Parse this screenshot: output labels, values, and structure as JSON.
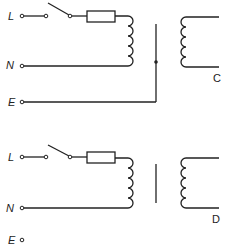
{
  "diagrams": [
    {
      "id": "C",
      "caption": "C",
      "terminals": [
        {
          "label": "L"
        },
        {
          "label": "N"
        },
        {
          "label": "E"
        }
      ],
      "core": "earthed screen (connected to E)"
    },
    {
      "id": "D",
      "caption": "D",
      "terminals": [
        {
          "label": "L"
        },
        {
          "label": "N"
        },
        {
          "label": "E"
        }
      ],
      "core": "isolated screen (E unconnected)"
    }
  ],
  "colors": {
    "line": "#222222",
    "background": "#ffffff"
  }
}
